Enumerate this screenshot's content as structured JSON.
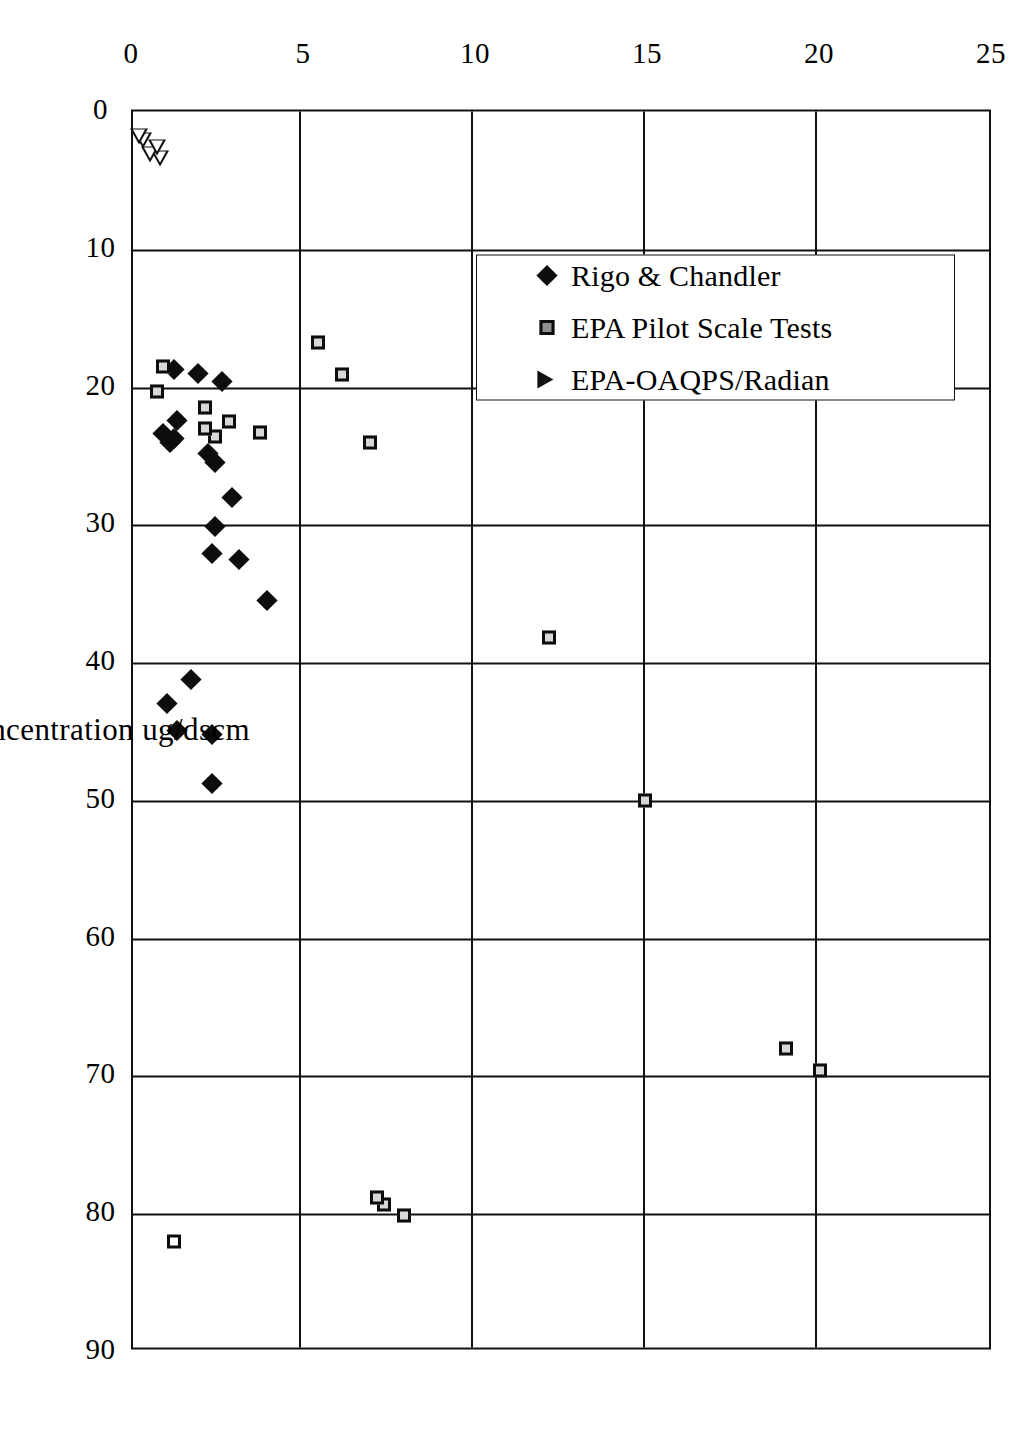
{
  "chart_data": {
    "type": "scatter",
    "title": "",
    "xlabel": "Cadmium Concentration  ug/dscm",
    "ylabel": "Standard Deviation",
    "xlim": [
      0,
      90
    ],
    "ylim": [
      0,
      25
    ],
    "xticks": [
      "0",
      "10",
      "20",
      "30",
      "40",
      "50",
      "60",
      "70",
      "80",
      "90"
    ],
    "yticks": [
      "0",
      "5",
      "10",
      "15",
      "20",
      "25"
    ],
    "grid": true,
    "legend_position": "inside-left",
    "orientation": "rotated-90-clockwise",
    "series": [
      {
        "name": "Rigo & Chandler",
        "marker": "filled-diamond",
        "color": "#0d0d0d",
        "points": [
          [
            48.8,
            2.4
          ],
          [
            45.2,
            2.4
          ],
          [
            44.9,
            1.4
          ],
          [
            43.0,
            1.1
          ],
          [
            41.2,
            1.8
          ],
          [
            35.5,
            4.0
          ],
          [
            32.5,
            3.2
          ],
          [
            32.1,
            2.4
          ],
          [
            30.1,
            2.5
          ],
          [
            28.0,
            3.0
          ],
          [
            25.5,
            2.5
          ],
          [
            24.8,
            2.3
          ],
          [
            24.0,
            1.2
          ],
          [
            23.7,
            1.3
          ],
          [
            23.4,
            1.0
          ],
          [
            22.4,
            1.4
          ],
          [
            19.6,
            2.7
          ],
          [
            19.0,
            2.0
          ],
          [
            18.7,
            1.3
          ]
        ]
      },
      {
        "name": "EPA Pilot Scale Tests",
        "marker": "filled-square",
        "color": "#0d0d0d",
        "points": [
          [
            82.0,
            1.3
          ],
          [
            80.1,
            8.0
          ],
          [
            79.3,
            7.4
          ],
          [
            78.8,
            7.2
          ],
          [
            69.6,
            20.1
          ],
          [
            68.0,
            19.1
          ],
          [
            50.0,
            15.0
          ],
          [
            38.2,
            12.2
          ],
          [
            24.0,
            7.0
          ],
          [
            23.3,
            3.8
          ],
          [
            23.6,
            2.5
          ],
          [
            23.0,
            2.2
          ],
          [
            22.5,
            2.9
          ],
          [
            21.5,
            2.2
          ],
          [
            20.3,
            0.8
          ],
          [
            19.1,
            6.2
          ],
          [
            18.5,
            1.0
          ],
          [
            16.8,
            5.5
          ]
        ]
      },
      {
        "name": "EPA-OAQPS/Radian",
        "marker": "open-triangle",
        "color": "#111111",
        "points": [
          [
            3.4,
            0.9
          ],
          [
            3.1,
            0.6
          ],
          [
            2.6,
            0.8
          ],
          [
            2.1,
            0.4
          ],
          [
            1.8,
            0.3
          ]
        ]
      }
    ],
    "open_square_points": [
      [
        82.0,
        1.3
      ]
    ]
  },
  "legend": {
    "items": [
      {
        "label": "Rigo & Chandler",
        "marker": "diamond"
      },
      {
        "label": "EPA Pilot Scale Tests",
        "marker": "square"
      },
      {
        "label": "EPA-OAQPS/Radian",
        "marker": "triangle"
      }
    ]
  }
}
